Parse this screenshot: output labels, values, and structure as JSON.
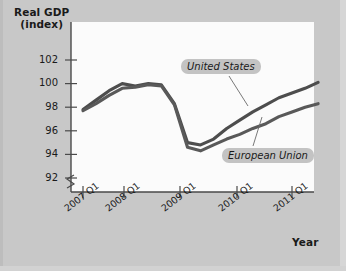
{
  "chart_data": {
    "type": "line",
    "title": "",
    "ylabel": "Real GDP (index)",
    "ylabel_line1": "Real GDP",
    "ylabel_line2": "(index)",
    "xlabel": "Year",
    "ylim": [
      91,
      103
    ],
    "yticks": [
      92,
      94,
      96,
      98,
      100,
      102
    ],
    "ytick_labels": [
      "92",
      "94",
      "96",
      "98",
      "100",
      "102"
    ],
    "y_axis_break": true,
    "grid": false,
    "legend_position": "inline-callouts",
    "xtick_labels": [
      "2007 Q1",
      "2008 Q1",
      "2009 Q1",
      "2010 Q1",
      "2011 Q1"
    ],
    "x": [
      "2007 Q1",
      "2007 Q2",
      "2007 Q3",
      "2007 Q4",
      "2008 Q1",
      "2008 Q2",
      "2008 Q3",
      "2008 Q4",
      "2009 Q1",
      "2009 Q2",
      "2009 Q3",
      "2009 Q4",
      "2010 Q1",
      "2010 Q2",
      "2010 Q3",
      "2010 Q4",
      "2011 Q1",
      "2011 Q2",
      "2011 Q3"
    ],
    "series": [
      {
        "name": "United States",
        "color": "#4d4d4d",
        "values": [
          97.8,
          98.6,
          99.4,
          100.0,
          99.8,
          100.0,
          99.9,
          98.3,
          95.0,
          94.8,
          95.3,
          96.2,
          96.9,
          97.6,
          98.2,
          98.8,
          99.2,
          99.6,
          100.1
        ]
      },
      {
        "name": "European Union",
        "color": "#595959",
        "values": [
          97.7,
          98.3,
          99.0,
          99.6,
          99.7,
          99.9,
          99.8,
          98.2,
          94.6,
          94.3,
          94.8,
          95.3,
          95.7,
          96.2,
          96.6,
          97.2,
          97.6,
          98.0,
          98.3
        ]
      }
    ],
    "annotations": [
      {
        "label": "United States",
        "target_series": "United States"
      },
      {
        "label": "European Union",
        "target_series": "European Union"
      }
    ]
  },
  "figure": {
    "background_color": "#c8c8c8",
    "plot_background_color": "#fbfbfb",
    "axis_color": "#4a4a4a"
  }
}
